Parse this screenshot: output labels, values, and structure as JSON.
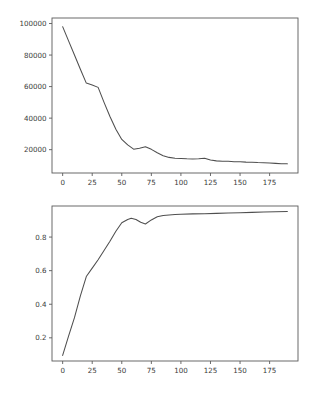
{
  "figure": {
    "background_color": "#ffffff",
    "line_color": "#4f4f4f",
    "axis_color": "#5a5a5a",
    "tick_label_color": "#3c3c3c",
    "width": 313,
    "height": 394,
    "subplot_count": 2
  },
  "chart_data": [
    {
      "type": "line",
      "title": "",
      "subtitle": "",
      "xlabel": "",
      "ylabel": "",
      "legend": [],
      "grid": false,
      "xlim": [
        -9,
        199
      ],
      "ylim": [
        5200,
        103500
      ],
      "xticks": [
        0,
        25,
        50,
        75,
        100,
        125,
        150,
        175
      ],
      "xticklabels": [
        "0",
        "25",
        "50",
        "75",
        "100",
        "125",
        "150",
        "175"
      ],
      "yticks": [
        20000,
        40000,
        60000,
        80000,
        100000
      ],
      "yticklabels": [
        "20000",
        "40000",
        "60000",
        "80000",
        "100000"
      ],
      "series": [
        {
          "name": "loss",
          "x": [
            0,
            5,
            10,
            15,
            20,
            25,
            30,
            35,
            40,
            45,
            50,
            55,
            60,
            65,
            70,
            75,
            80,
            85,
            90,
            95,
            100,
            105,
            110,
            115,
            120,
            125,
            130,
            135,
            140,
            145,
            150,
            155,
            160,
            165,
            170,
            175,
            180,
            185,
            190
          ],
          "y": [
            98000,
            89000,
            80000,
            71000,
            62200,
            61000,
            59500,
            50000,
            41000,
            33000,
            26500,
            23000,
            20300,
            20900,
            21800,
            20200,
            18000,
            16200,
            15100,
            14600,
            14400,
            14200,
            14100,
            14300,
            14600,
            13400,
            12900,
            12700,
            12600,
            12400,
            12300,
            12100,
            12000,
            11800,
            11700,
            11500,
            11300,
            11100,
            11000
          ]
        }
      ]
    },
    {
      "type": "line",
      "title": "",
      "subtitle": "",
      "xlabel": "",
      "ylabel": "",
      "legend": [],
      "grid": false,
      "xlim": [
        -9,
        199
      ],
      "ylim": [
        0.062,
        0.985
      ],
      "xticks": [
        0,
        25,
        50,
        75,
        100,
        125,
        150,
        175
      ],
      "xticklabels": [
        "0",
        "25",
        "50",
        "75",
        "100",
        "125",
        "150",
        "175"
      ],
      "yticks": [
        0.2,
        0.4,
        0.6,
        0.8
      ],
      "yticklabels": [
        "0.2",
        "0.4",
        "0.6",
        "0.8"
      ],
      "series": [
        {
          "name": "accuracy",
          "x": [
            0,
            5,
            10,
            15,
            20,
            25,
            30,
            35,
            40,
            45,
            50,
            55,
            58,
            62,
            66,
            70,
            75,
            80,
            85,
            90,
            95,
            100,
            110,
            120,
            130,
            140,
            150,
            160,
            170,
            180,
            190
          ],
          "y": [
            0.095,
            0.21,
            0.32,
            0.45,
            0.565,
            0.615,
            0.665,
            0.72,
            0.775,
            0.835,
            0.885,
            0.905,
            0.912,
            0.905,
            0.888,
            0.878,
            0.902,
            0.921,
            0.929,
            0.932,
            0.934,
            0.936,
            0.938,
            0.939,
            0.941,
            0.943,
            0.945,
            0.947,
            0.949,
            0.951,
            0.952
          ]
        }
      ]
    }
  ]
}
